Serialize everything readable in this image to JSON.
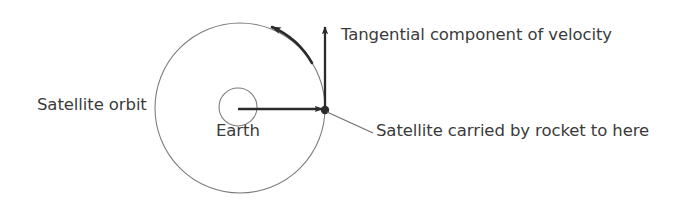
{
  "diagram": {
    "background_color": "#ffffff",
    "stroke_color_thin": "#6e6e6e",
    "stroke_color_bold": "#2b2b2b",
    "text_color": "#3b3b3b",
    "labels": {
      "satellite_orbit": "Satellite orbit",
      "earth": "Earth",
      "tangential_component": "Tangential component of velocity",
      "satellite_carried": "Satellite carried by rocket to here"
    },
    "shapes": {
      "orbit_circle": {
        "name": "orbit-circle",
        "cx": 240,
        "cy": 108,
        "r": 85
      },
      "earth_circle": {
        "name": "earth-circle",
        "cx": 238,
        "cy": 107,
        "r": 19
      },
      "satellite_point": {
        "name": "satellite-point",
        "x": 325,
        "y": 110,
        "r": 4
      },
      "radial_arrow": {
        "name": "radial-velocity-arrow",
        "x1": 238,
        "y1": 109,
        "x2": 325,
        "y2": 109
      },
      "tangential_arrow": {
        "name": "tangential-velocity-arrow",
        "x1": 325,
        "y1": 110,
        "x2": 325,
        "y2": 24
      },
      "orbit_direction_arrow": {
        "name": "orbit-direction-arrow",
        "angle_deg": 302,
        "direction": "counterclockwise"
      },
      "leader_line": {
        "name": "satellite-leader-line",
        "x1": 327,
        "y1": 112,
        "x2": 373,
        "y2": 133
      }
    }
  }
}
